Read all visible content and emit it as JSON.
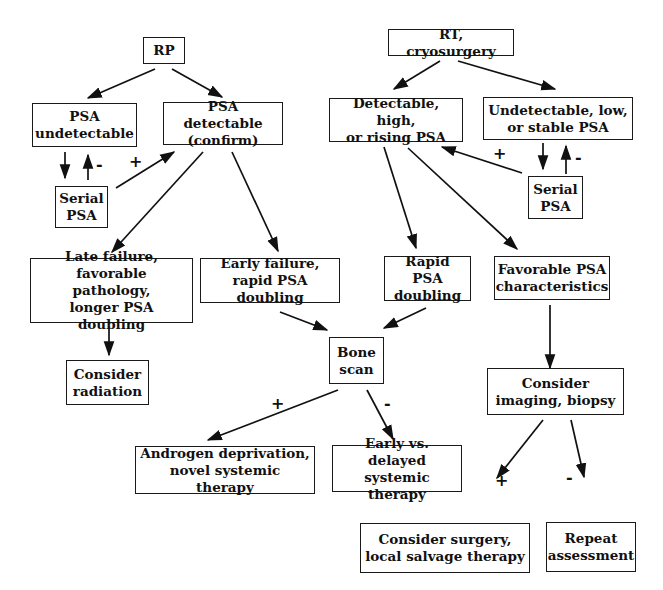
{
  "diagram": {
    "type": "flowchart",
    "nodes": {
      "rp": "RP",
      "rt": "RT, cryosurgery",
      "psa_undetectable": "PSA\nundetectable",
      "psa_detectable": "PSA detectable\n(confirm)",
      "serial_psa_left": "Serial\nPSA",
      "detectable_high": "Detectable, high,\nor rising PSA",
      "undetectable_low": "Undetectable, low,\nor stable PSA",
      "serial_psa_right": "Serial\nPSA",
      "late_failure": "Late failure,\nfavorable pathology,\nlonger PSA doubling",
      "early_failure": "Early failure,\nrapid PSA doubling",
      "rapid_psa": "Rapid PSA\ndoubling",
      "favorable_psa": "Favorable PSA\ncharacteristics",
      "consider_radiation": "Consider\nradiation",
      "bone_scan": "Bone\nscan",
      "consider_imaging": "Consider\nimaging, biopsy",
      "androgen": "Androgen deprivation,\nnovel systemic therapy",
      "early_vs_delayed": "Early vs. delayed\nsystemic therapy",
      "consider_surgery": "Consider surgery,\nlocal salvage therapy",
      "repeat_assessment": "Repeat\nassessment"
    },
    "edge_labels": {
      "left_serial_plus": "+",
      "left_serial_minus": "-",
      "right_serial_plus": "+",
      "right_serial_minus": "-",
      "bone_plus": "+",
      "bone_minus": "-",
      "imaging_plus": "+",
      "imaging_minus": "-"
    },
    "edges": [
      [
        "rp",
        "psa_undetectable"
      ],
      [
        "rp",
        "psa_detectable"
      ],
      [
        "psa_undetectable",
        "serial_psa_left"
      ],
      [
        "serial_psa_left",
        "psa_undetectable",
        "-"
      ],
      [
        "serial_psa_left",
        "psa_detectable",
        "+"
      ],
      [
        "psa_detectable",
        "late_failure"
      ],
      [
        "psa_detectable",
        "early_failure"
      ],
      [
        "late_failure",
        "consider_radiation"
      ],
      [
        "rt",
        "detectable_high"
      ],
      [
        "rt",
        "undetectable_low"
      ],
      [
        "undetectable_low",
        "serial_psa_right"
      ],
      [
        "serial_psa_right",
        "undetectable_low",
        "-"
      ],
      [
        "serial_psa_right",
        "detectable_high",
        "+"
      ],
      [
        "detectable_high",
        "rapid_psa"
      ],
      [
        "detectable_high",
        "favorable_psa"
      ],
      [
        "early_failure",
        "bone_scan"
      ],
      [
        "rapid_psa",
        "bone_scan"
      ],
      [
        "bone_scan",
        "androgen",
        "+"
      ],
      [
        "bone_scan",
        "early_vs_delayed",
        "-"
      ],
      [
        "favorable_psa",
        "consider_imaging"
      ],
      [
        "consider_imaging",
        "consider_surgery",
        "+"
      ],
      [
        "consider_imaging",
        "repeat_assessment",
        "-"
      ]
    ]
  }
}
